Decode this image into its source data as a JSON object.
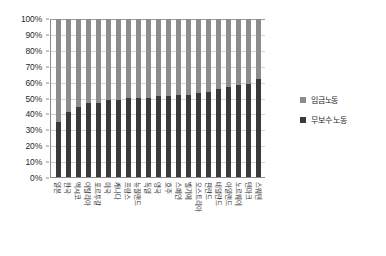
{
  "chart_data": {
    "type": "bar",
    "subtype": "100% stacked column",
    "title": "",
    "xlabel": "",
    "ylabel": "",
    "ylim": [
      0,
      100
    ],
    "ytick_labels": [
      "100%",
      "90%",
      "80%",
      "70%",
      "60%",
      "50%",
      "40%",
      "30%",
      "20%",
      "10%",
      "0%"
    ],
    "ytick_values": [
      100,
      90,
      80,
      70,
      60,
      50,
      40,
      30,
      20,
      10,
      0
    ],
    "grid": true,
    "legend_position": "right",
    "categories": [
      "일본",
      "한국",
      "멕시코",
      "이탈리아",
      "포르투갈",
      "미국",
      "캐나다",
      "프랑스",
      "뉴질랜드",
      "독일",
      "영국",
      "호주",
      "스페인",
      "벨기에",
      "오스트리아",
      "핀란드",
      "네덜란드",
      "아일랜드",
      "노르웨이",
      "덴마크",
      "스웨덴"
    ],
    "series": [
      {
        "name": "무보수 노동",
        "color": "#3a3a3a",
        "values": [
          35,
          41,
          44,
          47,
          47,
          49,
          49,
          50,
          50,
          50,
          51,
          51,
          52,
          52,
          53,
          54,
          56,
          57,
          58,
          59,
          62
        ]
      },
      {
        "name": "임금노동",
        "color": "#8c8c8c",
        "values": [
          65,
          59,
          56,
          53,
          53,
          51,
          51,
          50,
          50,
          50,
          49,
          49,
          48,
          48,
          47,
          46,
          44,
          43,
          42,
          41,
          38
        ]
      }
    ]
  },
  "legend": {
    "items": [
      {
        "label": "임금노동",
        "color": "#8c8c8c"
      },
      {
        "label": "무보수 노동",
        "color": "#3a3a3a"
      }
    ]
  }
}
